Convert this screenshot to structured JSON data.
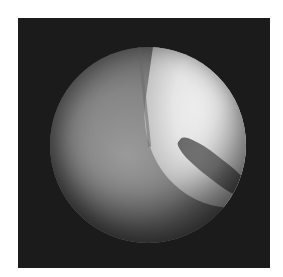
{
  "image": {
    "description": "Grayscale arthroscopic view: circular endoscope field on a black square background, showing a bright smooth cartilage surface upper-right and fibrous tissue lower-left separated by a dark cleft",
    "colors": {
      "background": "#ffffff",
      "frame": "#1b1b1b",
      "bright_region": "#f0f0f0",
      "tissue": "#8a8a8a",
      "cleft": "#4a4a4a"
    }
  }
}
